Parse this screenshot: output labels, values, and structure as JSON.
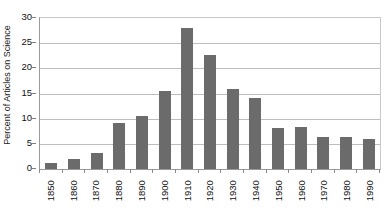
{
  "chart_data": {
    "type": "bar",
    "title": "",
    "xlabel": "",
    "ylabel": "Percent of Articles on Science",
    "categories": [
      "1850",
      "1860",
      "1870",
      "1880",
      "1890",
      "1900",
      "1910",
      "1920",
      "1930",
      "1940",
      "1950",
      "1960",
      "1970",
      "1980",
      "1990"
    ],
    "values": [
      1.2,
      2.0,
      3.1,
      9.2,
      10.6,
      15.5,
      28.0,
      22.7,
      15.9,
      14.1,
      8.1,
      8.4,
      6.4,
      6.4,
      6.0
    ],
    "ylim": [
      0,
      30
    ],
    "ytick_labels": [
      "0",
      "5",
      "10",
      "15",
      "20",
      "25",
      "30"
    ],
    "ytick_values": [
      0,
      5,
      10,
      15,
      20,
      25,
      30
    ],
    "grid": true,
    "grid_axis": "y",
    "legend": false,
    "legend_position": "none",
    "colors": {
      "bar_fill": "#6b6b6b",
      "gridline": "#bdbdbd",
      "axis_line": "#9a9a9a",
      "plot_border": "#c8c8c8",
      "text": "#111111",
      "background": "#ffffff"
    }
  }
}
